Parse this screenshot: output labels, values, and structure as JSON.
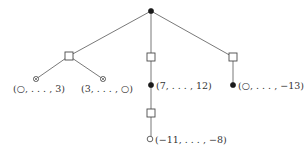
{
  "diagram": {
    "type": "tree",
    "colors": {
      "edge": "#6a6a6a",
      "filled_node": "#1a1a1a",
      "open_node_stroke": "#555555",
      "label": "#333333"
    },
    "nodes": [
      {
        "id": "root",
        "shape": "filled-circle",
        "x": 151,
        "y": 11
      },
      {
        "id": "sq-left",
        "shape": "square",
        "x": 69,
        "y": 56
      },
      {
        "id": "sq-mid",
        "shape": "square",
        "x": 151,
        "y": 57
      },
      {
        "id": "sq-right",
        "shape": "square",
        "x": 233,
        "y": 57
      },
      {
        "id": "leaf-ll",
        "shape": "crossed-circle",
        "x": 36,
        "y": 79,
        "label": "(○, . . . , 3)"
      },
      {
        "id": "leaf-lr",
        "shape": "crossed-circle",
        "x": 103,
        "y": 79,
        "label": "(3, . . . , ○)"
      },
      {
        "id": "mid-filled",
        "shape": "filled-circle",
        "x": 151,
        "y": 85,
        "label": "(7, . . . , 12)"
      },
      {
        "id": "sq-mid-lower",
        "shape": "square",
        "x": 151,
        "y": 113
      },
      {
        "id": "mid-open",
        "shape": "open-circle",
        "x": 151,
        "y": 139,
        "label": "(−11, . . . , −8)"
      },
      {
        "id": "right-filled",
        "shape": "filled-circle",
        "x": 233,
        "y": 85,
        "label": "(○, . . . , −13)"
      }
    ],
    "edges": [
      [
        "root",
        "sq-left"
      ],
      [
        "root",
        "sq-mid"
      ],
      [
        "root",
        "sq-right"
      ],
      [
        "sq-left",
        "leaf-ll"
      ],
      [
        "sq-left",
        "leaf-lr"
      ],
      [
        "sq-mid",
        "mid-filled"
      ],
      [
        "mid-filled",
        "sq-mid-lower"
      ],
      [
        "sq-mid-lower",
        "mid-open"
      ],
      [
        "sq-right",
        "right-filled"
      ]
    ],
    "labels": {
      "leaf_ll": "(○, . . . , 3)",
      "leaf_lr": "(3, . . . , ○)",
      "mid_filled": "(7, . . . , 12)",
      "mid_open": "(−11, . . . , −8)",
      "right_filled": "(○, . . . , −13)"
    }
  }
}
